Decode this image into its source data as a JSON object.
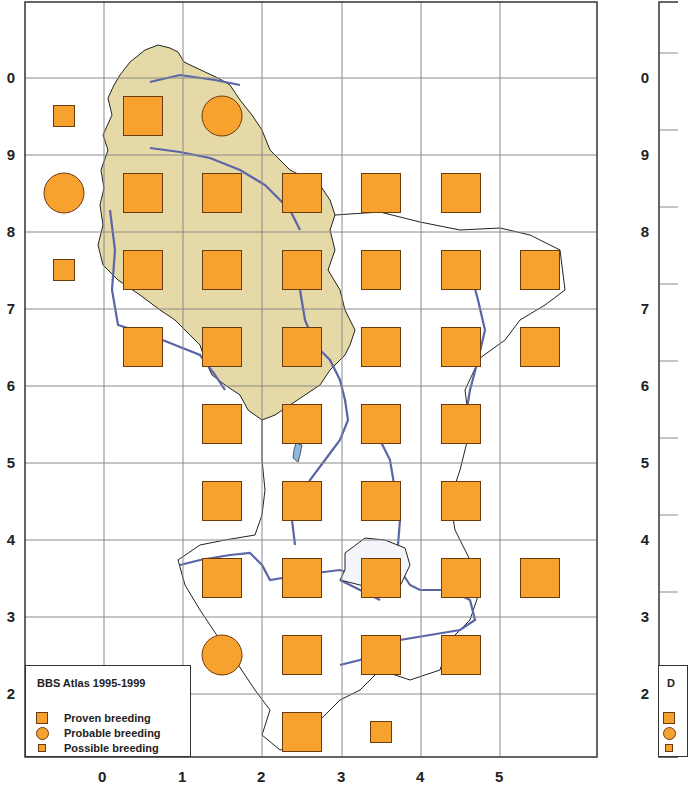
{
  "left_map": {
    "legend": {
      "title": "BBS Atlas 1995-1999",
      "items": [
        {
          "symbol": "square",
          "label": "Proven breeding"
        },
        {
          "symbol": "circle",
          "label": "Probable breeding"
        },
        {
          "symbol": "small-square",
          "label": "Possible breeding"
        }
      ]
    },
    "y_labels": [
      "0",
      "9",
      "8",
      "7",
      "6",
      "5",
      "4",
      "3",
      "2"
    ],
    "x_labels": [
      "0",
      "1",
      "2",
      "3",
      "4",
      "5"
    ],
    "colors": {
      "symbol_fill": "#f7a22e",
      "symbol_stroke": "#6b3b10",
      "land_fill": "#e6d9a8",
      "river": "#5a65a8",
      "grid": "#888888",
      "lake": "#8fb8e0"
    },
    "records": [
      {
        "row": 0,
        "col": 0,
        "status": "possible"
      },
      {
        "row": 0,
        "col": 1,
        "status": "proven"
      },
      {
        "row": 0,
        "col": 2,
        "status": "probable"
      },
      {
        "row": 1,
        "col": 0,
        "status": "probable"
      },
      {
        "row": 1,
        "col": 1,
        "status": "proven"
      },
      {
        "row": 1,
        "col": 2,
        "status": "proven"
      },
      {
        "row": 1,
        "col": 3,
        "status": "proven"
      },
      {
        "row": 1,
        "col": 4,
        "status": "proven"
      },
      {
        "row": 1,
        "col": 5,
        "status": "proven"
      },
      {
        "row": 2,
        "col": 0,
        "status": "possible"
      },
      {
        "row": 2,
        "col": 1,
        "status": "proven"
      },
      {
        "row": 2,
        "col": 2,
        "status": "proven"
      },
      {
        "row": 2,
        "col": 3,
        "status": "proven"
      },
      {
        "row": 2,
        "col": 4,
        "status": "proven"
      },
      {
        "row": 2,
        "col": 5,
        "status": "proven"
      },
      {
        "row": 2,
        "col": 6,
        "status": "proven"
      },
      {
        "row": 3,
        "col": 1,
        "status": "proven"
      },
      {
        "row": 3,
        "col": 2,
        "status": "proven"
      },
      {
        "row": 3,
        "col": 3,
        "status": "proven"
      },
      {
        "row": 3,
        "col": 4,
        "status": "proven"
      },
      {
        "row": 3,
        "col": 5,
        "status": "proven"
      },
      {
        "row": 3,
        "col": 6,
        "status": "proven"
      },
      {
        "row": 4,
        "col": 2,
        "status": "proven"
      },
      {
        "row": 4,
        "col": 3,
        "status": "proven"
      },
      {
        "row": 4,
        "col": 4,
        "status": "proven"
      },
      {
        "row": 4,
        "col": 5,
        "status": "proven"
      },
      {
        "row": 5,
        "col": 2,
        "status": "proven"
      },
      {
        "row": 5,
        "col": 3,
        "status": "proven"
      },
      {
        "row": 5,
        "col": 4,
        "status": "proven"
      },
      {
        "row": 5,
        "col": 5,
        "status": "proven"
      },
      {
        "row": 6,
        "col": 2,
        "status": "proven"
      },
      {
        "row": 6,
        "col": 3,
        "status": "proven"
      },
      {
        "row": 6,
        "col": 4,
        "status": "proven"
      },
      {
        "row": 6,
        "col": 5,
        "status": "proven"
      },
      {
        "row": 6,
        "col": 6,
        "status": "proven"
      },
      {
        "row": 7,
        "col": 2,
        "status": "probable"
      },
      {
        "row": 7,
        "col": 3,
        "status": "proven"
      },
      {
        "row": 7,
        "col": 4,
        "status": "proven"
      },
      {
        "row": 7,
        "col": 5,
        "status": "proven"
      },
      {
        "row": 8,
        "col": 3,
        "status": "proven"
      },
      {
        "row": 8,
        "col": 4,
        "status": "possible"
      }
    ]
  },
  "right_map": {
    "y_labels": [
      "0",
      "9",
      "8",
      "7",
      "6",
      "5",
      "4",
      "3",
      "2"
    ],
    "legend_partial_title": "D"
  }
}
